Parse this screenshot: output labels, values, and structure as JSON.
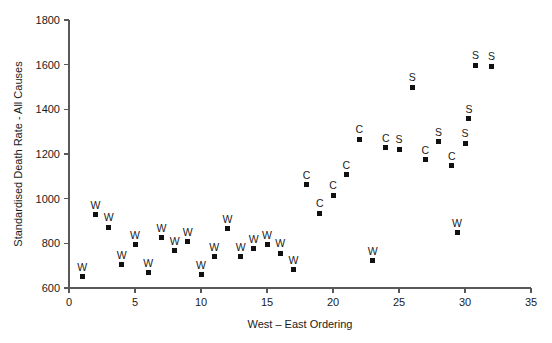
{
  "chart_data": {
    "type": "scatter",
    "title": "",
    "xlabel": "West – East Ordering",
    "ylabel": "Standardised Death Rate - All Causes",
    "xlim": [
      0,
      35
    ],
    "ylim": [
      600,
      1800
    ],
    "xticks": [
      0,
      5,
      10,
      15,
      20,
      25,
      30,
      35
    ],
    "yticks": [
      600,
      800,
      1000,
      1200,
      1400,
      1600,
      1800
    ],
    "grid": false,
    "legend": "none",
    "marker": "filled-square",
    "point_label_position": "above",
    "points": [
      {
        "x": 1,
        "y": 650,
        "label": "W"
      },
      {
        "x": 2,
        "y": 928,
        "label": "W"
      },
      {
        "x": 3,
        "y": 872,
        "label": "W"
      },
      {
        "x": 4,
        "y": 705,
        "label": "W"
      },
      {
        "x": 5,
        "y": 793,
        "label": "W"
      },
      {
        "x": 6,
        "y": 668,
        "label": "W"
      },
      {
        "x": 7,
        "y": 824,
        "label": "W"
      },
      {
        "x": 8,
        "y": 766,
        "label": "W"
      },
      {
        "x": 9,
        "y": 806,
        "label": "W"
      },
      {
        "x": 10,
        "y": 660,
        "label": "W"
      },
      {
        "x": 11,
        "y": 740,
        "label": "W"
      },
      {
        "x": 12,
        "y": 866,
        "label": "W"
      },
      {
        "x": 13,
        "y": 740,
        "label": "W"
      },
      {
        "x": 14,
        "y": 775,
        "label": "W"
      },
      {
        "x": 15,
        "y": 793,
        "label": "W"
      },
      {
        "x": 16,
        "y": 756,
        "label": "W"
      },
      {
        "x": 17,
        "y": 682,
        "label": "W"
      },
      {
        "x": 18,
        "y": 1062,
        "label": "C"
      },
      {
        "x": 19,
        "y": 935,
        "label": "C"
      },
      {
        "x": 20,
        "y": 1015,
        "label": "C"
      },
      {
        "x": 21,
        "y": 1108,
        "label": "C"
      },
      {
        "x": 22,
        "y": 1265,
        "label": "C"
      },
      {
        "x": 23,
        "y": 722,
        "label": "W"
      },
      {
        "x": 24,
        "y": 1228,
        "label": "C"
      },
      {
        "x": 25,
        "y": 1222,
        "label": "S"
      },
      {
        "x": 26,
        "y": 1500,
        "label": "S"
      },
      {
        "x": 27,
        "y": 1175,
        "label": "C"
      },
      {
        "x": 28,
        "y": 1255,
        "label": "S"
      },
      {
        "x": 29,
        "y": 1148,
        "label": "C"
      },
      {
        "x": 29.4,
        "y": 848,
        "label": "W"
      },
      {
        "x": 30,
        "y": 1248,
        "label": "S"
      },
      {
        "x": 30.3,
        "y": 1358,
        "label": "S"
      },
      {
        "x": 30.8,
        "y": 1598,
        "label": "S"
      },
      {
        "x": 32,
        "y": 1592,
        "label": "S"
      }
    ]
  },
  "figure": {
    "background_color": "#ffffff",
    "axis_color": "#58585a",
    "marker_color": "#111111",
    "text_color": "#1a1a1a"
  }
}
